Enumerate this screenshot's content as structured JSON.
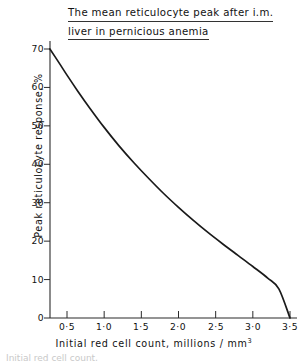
{
  "figure": {
    "title_line1": "The mean reticulocyte peak after i.m.",
    "title_line2": "liver in pernicious anemia",
    "caption_cut": "Initial red cell count,"
  },
  "chart_data": {
    "type": "line",
    "title": "The mean reticulocyte peak after i.m. liver in pernicious anemia",
    "xlabel": "Initial red cell count,  millions / mm",
    "xlabel_sup": "3",
    "ylabel": "Peak reticulocyte response, %",
    "xlim": [
      0.27,
      3.5
    ],
    "ylim": [
      0,
      70
    ],
    "grid": false,
    "legend": null,
    "xticks": [
      0.5,
      1.0,
      1.5,
      2.0,
      2.5,
      3.0,
      3.5
    ],
    "xticklabels": [
      "0·5",
      "1·0",
      "1·5",
      "2·0",
      "2·5",
      "3·0",
      "3·5"
    ],
    "yticks": [
      0,
      10,
      20,
      30,
      40,
      50,
      60,
      70
    ],
    "yticklabels": [
      "0",
      "10",
      "20",
      "30",
      "40",
      "50",
      "60",
      "70"
    ],
    "series": [
      {
        "name": "mean reticulocyte peak",
        "color": "#1a1a1a",
        "x": [
          0.27,
          0.4,
          0.5,
          0.65,
          0.8,
          1.0,
          1.2,
          1.4,
          1.6,
          1.8,
          2.0,
          2.2,
          2.4,
          2.6,
          2.8,
          3.0,
          3.2,
          3.35,
          3.5
        ],
        "y": [
          70.0,
          66.2,
          63.2,
          58.9,
          54.8,
          49.6,
          44.8,
          40.4,
          36.3,
          32.4,
          28.8,
          25.4,
          22.2,
          19.2,
          16.3,
          13.4,
          10.4,
          7.6,
          0.0
        ]
      }
    ]
  },
  "axis_labels": {
    "y": [
      "70",
      "60",
      "50",
      "40",
      "30",
      "20",
      "10",
      "0"
    ],
    "x": [
      "0·5",
      "1·0",
      "1·5",
      "2·0",
      "2·5",
      "3·0",
      "3·5"
    ]
  }
}
